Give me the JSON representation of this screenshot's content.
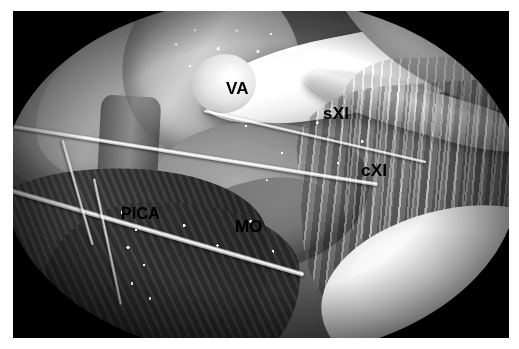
{
  "figure": {
    "kind": "surgical-photograph",
    "modality": "intraoperative microsurgical photograph",
    "color_mode": "grayscale",
    "view": "far-lateral / craniovertebral junction exposure",
    "width_px": 519,
    "height_px": 349,
    "plate": {
      "left_px": 13,
      "top_px": 11,
      "width_px": 496,
      "height_px": 327,
      "border_color": "#ffffff",
      "background_color": "#000000"
    }
  },
  "labels": [
    {
      "id": "va",
      "text": "VA",
      "meaning": "vertebral artery",
      "x_px": 213,
      "y_px": 69,
      "color": "#000000"
    },
    {
      "id": "sxi",
      "text": "sXI",
      "meaning": "spinal root of the accessory nerve",
      "x_px": 310,
      "y_px": 94,
      "color": "#000000"
    },
    {
      "id": "cxi",
      "text": "cXI",
      "meaning": "cranial root of the accessory nerve",
      "x_px": 348,
      "y_px": 151,
      "color": "#000000"
    },
    {
      "id": "pica",
      "text": "PICA",
      "meaning": "posterior inferior cerebellar artery",
      "x_px": 108,
      "y_px": 194,
      "color": "#000000"
    },
    {
      "id": "mo",
      "text": "MO",
      "meaning": "medulla oblongata",
      "x_px": 222,
      "y_px": 207,
      "color": "#000000"
    }
  ],
  "palette": {
    "page": "#ffffff",
    "field_dark": "#000000",
    "tissue_mid": "#8f8f8f",
    "tissue_light": "#c9c9c9",
    "nerve_white": "#ffffff",
    "muscle_dark": "#3b3b3b",
    "label_text": "#000000"
  }
}
